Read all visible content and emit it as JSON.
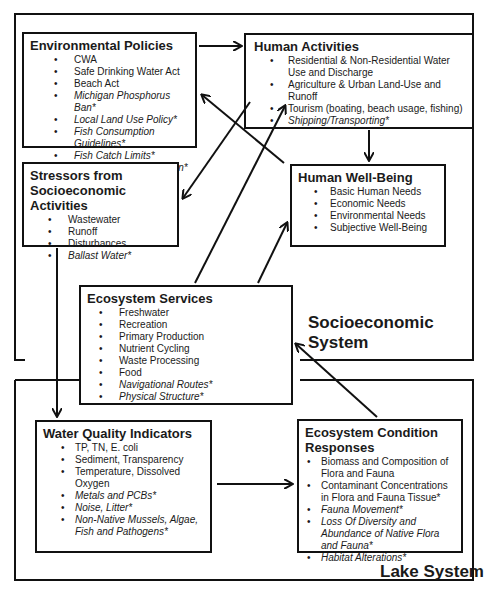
{
  "systems": {
    "socioeconomic": {
      "label": "Socioeconomic System"
    },
    "lake": {
      "label": "Lake System"
    }
  },
  "boxes": {
    "environmental_policies": {
      "title": "Environmental Policies",
      "items": [
        {
          "text": "CWA",
          "italic": false
        },
        {
          "text": "Safe Drinking Water Act",
          "italic": false
        },
        {
          "text": "Beach Act",
          "italic": false
        },
        {
          "text": "Michigan Phosphorus Ban*",
          "italic": true
        },
        {
          "text": "Local Land Use Policy*",
          "italic": true
        },
        {
          "text": "Fish Consumption Guidelines*",
          "italic": true
        },
        {
          "text": "Fish Catch Limits*",
          "italic": true
        },
        {
          "text": "Ballast Water Regulation*",
          "italic": true
        }
      ]
    },
    "human_activities": {
      "title": "Human Activities",
      "items": [
        {
          "text": "Residential & Non-Residential Water Use and Discharge",
          "italic": false
        },
        {
          "text": "Agriculture & Urban Land-Use and Runoff",
          "italic": false
        },
        {
          "text": "Tourism (boating, beach usage, fishing)",
          "italic": false
        },
        {
          "text": "Shipping/Transporting*",
          "italic": true
        }
      ]
    },
    "stressors": {
      "title": "Stressors from Socioeconomic Activities",
      "items": [
        {
          "text": "Wastewater",
          "italic": false
        },
        {
          "text": "Runoff",
          "italic": false
        },
        {
          "text": "Disturbances",
          "italic": false
        },
        {
          "text": "Ballast Water*",
          "italic": true
        }
      ]
    },
    "human_well_being": {
      "title": "Human Well-Being",
      "items": [
        {
          "text": "Basic Human Needs",
          "italic": false
        },
        {
          "text": "Economic Needs",
          "italic": false
        },
        {
          "text": "Environmental Needs",
          "italic": false
        },
        {
          "text": "Subjective Well-Being",
          "italic": false
        }
      ]
    },
    "ecosystem_services": {
      "title": "Ecosystem Services",
      "items": [
        {
          "text": "Freshwater",
          "italic": false
        },
        {
          "text": "Recreation",
          "italic": false
        },
        {
          "text": "Primary Production",
          "italic": false
        },
        {
          "text": "Nutrient Cycling",
          "italic": false
        },
        {
          "text": "Waste Processing",
          "italic": false
        },
        {
          "text": "Food",
          "italic": false
        },
        {
          "text": "Navigational Routes*",
          "italic": true
        },
        {
          "text": "Physical Structure*",
          "italic": true
        }
      ]
    },
    "water_quality": {
      "title": "Water Quality Indicators",
      "items": [
        {
          "text": "TP, TN, E. coli",
          "italic": false
        },
        {
          "text": "Sediment, Transparency",
          "italic": false
        },
        {
          "text": "Temperature, Dissolved Oxygen",
          "italic": false
        },
        {
          "text": "Metals and PCBs*",
          "italic": true
        },
        {
          "text": "Noise, Litter*",
          "italic": true
        },
        {
          "text": "Non-Native Mussels, Algae, Fish and Pathogens*",
          "italic": true
        }
      ]
    },
    "ecosystem_condition": {
      "title": "Ecosystem Condition Responses",
      "items": [
        {
          "text": "Biomass and Composition of Flora and Fauna",
          "italic": false
        },
        {
          "text": "Contaminant Concentrations in Flora and Fauna Tissue*",
          "italic": false
        },
        {
          "text": "Fauna Movement*",
          "italic": true
        },
        {
          "text": "Loss Of Diversity and Abundance of Native Flora and Fauna*",
          "italic": true
        },
        {
          "text": "Habitat Alterations*",
          "italic": true
        }
      ]
    }
  },
  "bullet": "•",
  "edges": [
    {
      "from": "environmental_policies",
      "to": "human_activities"
    },
    {
      "from": "human_activities",
      "to": "human_well_being"
    },
    {
      "from": "human_activities",
      "to": "stressors"
    },
    {
      "from": "human_well_being",
      "to": "environmental_policies"
    },
    {
      "from": "ecosystem_services",
      "to": "human_activities"
    },
    {
      "from": "ecosystem_services",
      "to": "human_well_being"
    },
    {
      "from": "stressors",
      "to": "water_quality"
    },
    {
      "from": "water_quality",
      "to": "ecosystem_condition"
    },
    {
      "from": "ecosystem_condition",
      "to": "ecosystem_services"
    }
  ]
}
